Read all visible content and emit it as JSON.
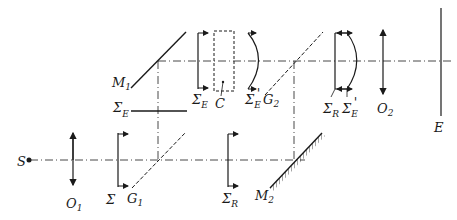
{
  "diagram": {
    "type": "optical interferometer schematic",
    "labels": {
      "source": "S",
      "lens1": {
        "main": "O",
        "sub": "1"
      },
      "lens2": {
        "main": "O",
        "sub": "2"
      },
      "sigma": "Σ",
      "splitter1": {
        "main": "G",
        "sub": "1"
      },
      "splitter2": {
        "main": "G",
        "sub": "2"
      },
      "mirror1": {
        "main": "M",
        "sub": "1"
      },
      "mirror2": {
        "main": "M",
        "sub": "2"
      },
      "sigma_r_lower": {
        "main": "Σ",
        "sub": "R"
      },
      "sigma_e_left": {
        "main": "Σ",
        "sub": "E"
      },
      "sigma_e_top": {
        "main": "Σ",
        "sub": "E"
      },
      "cell": "C",
      "sigma_e_prime": {
        "main": "Σ",
        "sub": "E",
        "prime": "'"
      },
      "sigma_r_right": {
        "main": "Σ",
        "sub": "R"
      },
      "sigma_e_prime_right": {
        "main": "Σ",
        "sub": "E",
        "prime": "'"
      },
      "screen": "E"
    }
  }
}
